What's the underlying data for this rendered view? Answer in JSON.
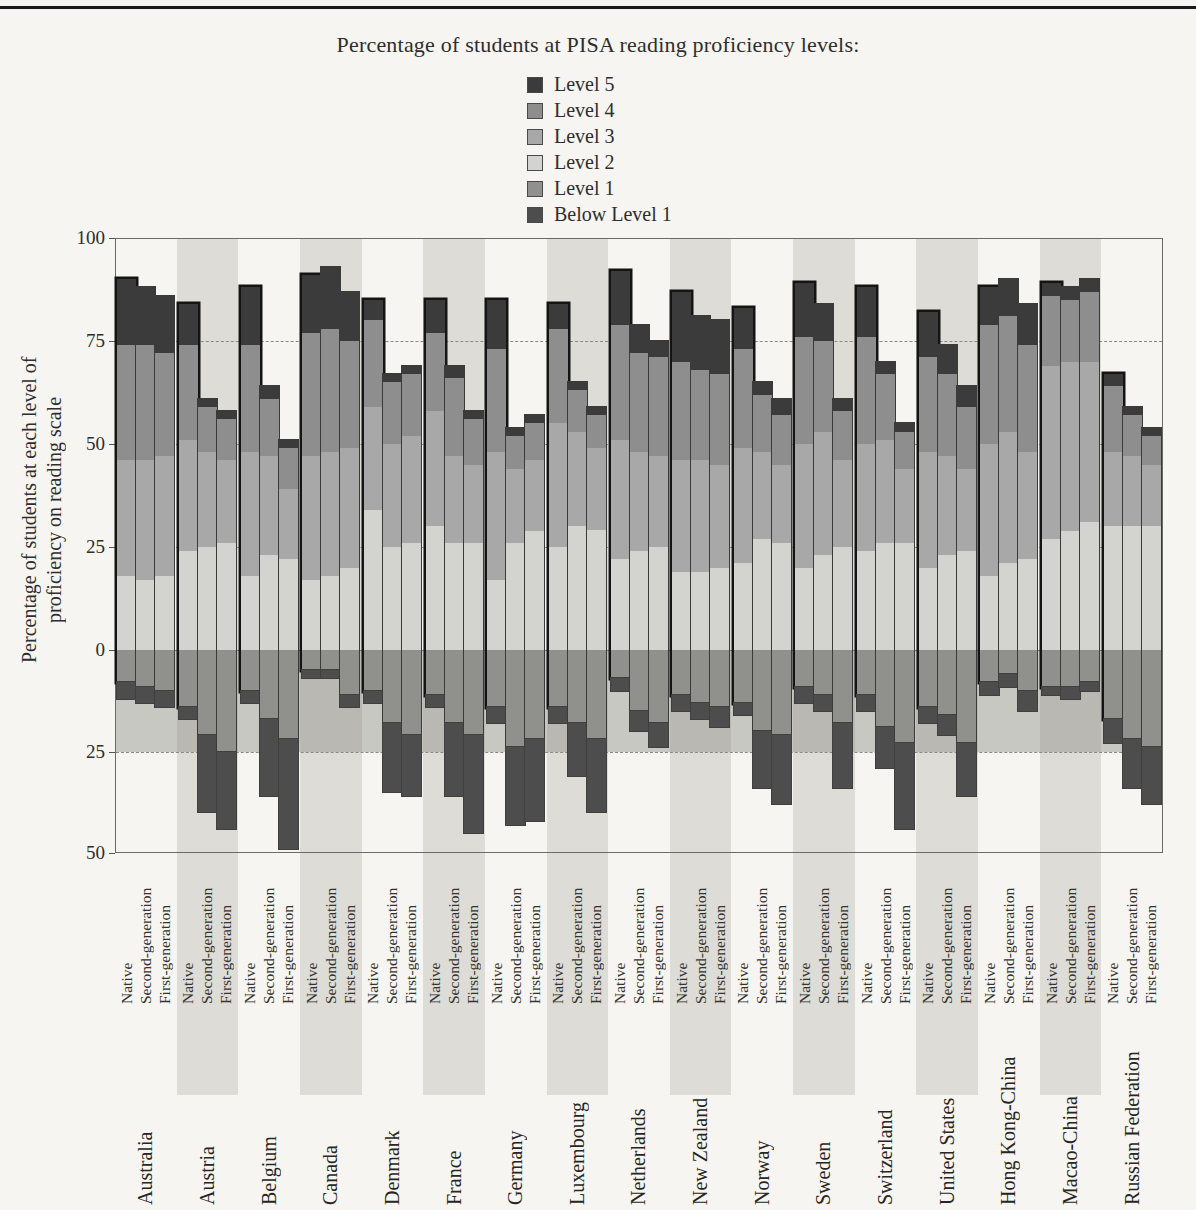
{
  "page": {
    "title": "Percentage of students at PISA reading proficiency levels:"
  },
  "legend": {
    "items": [
      {
        "label": "Level 5",
        "color": "#3b3b3b"
      },
      {
        "label": "Level 4",
        "color": "#8e8e8e"
      },
      {
        "label": "Level 3",
        "color": "#a8a8a8"
      },
      {
        "label": "Level 2",
        "color": "#d3d3d0"
      },
      {
        "label": "Level 1",
        "color": "#90908c"
      },
      {
        "label": "Below Level 1",
        "color": "#4d4d4d"
      }
    ]
  },
  "colors": {
    "level5": "#3b3b3b",
    "level4": "#8e8e8e",
    "level3": "#a8a8a8",
    "level2": "#d3d3d0",
    "level1": "#90908c",
    "below_level1": "#4d4d4d",
    "band": "#dddcd7",
    "page_bg": "#f6f5f1"
  },
  "chart_data": {
    "type": "bar",
    "stacked": true,
    "diverging": true,
    "title": "Percentage of students at PISA reading proficiency levels:",
    "ylabel_lines": [
      "Percentage of students at each level of",
      "proficiency on reading scale"
    ],
    "xlabel": "",
    "ylim": [
      -50,
      100
    ],
    "grid": "dashed horizontal at 75, 50, 25 and -25; solid zero line",
    "legend_position": "top-center",
    "y_ticks": [
      {
        "value": 100,
        "label": "100"
      },
      {
        "value": 75,
        "label": "75"
      },
      {
        "value": 50,
        "label": "50"
      },
      {
        "value": 25,
        "label": "25"
      },
      {
        "value": 0,
        "label": "0"
      },
      {
        "value": -25,
        "label": "25"
      },
      {
        "value": -50,
        "label": "50"
      }
    ],
    "up_levels": [
      "Level 2",
      "Level 3",
      "Level 4",
      "Level 5"
    ],
    "down_levels": [
      "Level 1",
      "Below Level 1"
    ],
    "group_labels": [
      "Native",
      "Second-generation",
      "First-generation"
    ],
    "countries": [
      {
        "name": "Australia",
        "band": false,
        "bars": [
          {
            "label": "Native",
            "up": [
              18,
              28,
              28,
              16
            ],
            "down": [
              8,
              4
            ]
          },
          {
            "label": "Second-generation",
            "up": [
              17,
              29,
              28,
              14
            ],
            "down": [
              9,
              4
            ]
          },
          {
            "label": "First-generation",
            "up": [
              18,
              29,
              25,
              14
            ],
            "down": [
              10,
              4
            ]
          }
        ]
      },
      {
        "name": "Austria",
        "band": true,
        "bars": [
          {
            "label": "Native",
            "up": [
              24,
              27,
              23,
              10
            ],
            "down": [
              14,
              3
            ]
          },
          {
            "label": "Second-generation",
            "up": [
              25,
              23,
              11,
              2
            ],
            "down": [
              21,
              19
            ]
          },
          {
            "label": "First-generation",
            "up": [
              26,
              20,
              10,
              2
            ],
            "down": [
              25,
              19
            ]
          }
        ]
      },
      {
        "name": "Belgium",
        "band": false,
        "bars": [
          {
            "label": "Native",
            "up": [
              18,
              30,
              26,
              14
            ],
            "down": [
              10,
              3
            ]
          },
          {
            "label": "Second-generation",
            "up": [
              23,
              24,
              14,
              3
            ],
            "down": [
              17,
              19
            ]
          },
          {
            "label": "First-generation",
            "up": [
              22,
              17,
              10,
              2
            ],
            "down": [
              22,
              27
            ]
          }
        ]
      },
      {
        "name": "Canada",
        "band": true,
        "bars": [
          {
            "label": "Native",
            "up": [
              17,
              30,
              30,
              14
            ],
            "down": [
              5,
              2
            ]
          },
          {
            "label": "Second-generation",
            "up": [
              18,
              30,
              30,
              15
            ],
            "down": [
              5,
              2
            ]
          },
          {
            "label": "First-generation",
            "up": [
              20,
              29,
              26,
              12
            ],
            "down": [
              11,
              3
            ]
          }
        ]
      },
      {
        "name": "Denmark",
        "band": false,
        "bars": [
          {
            "label": "Native",
            "up": [
              34,
              25,
              21,
              5
            ],
            "down": [
              10,
              3
            ]
          },
          {
            "label": "Second-generation",
            "up": [
              25,
              25,
              15,
              2
            ],
            "down": [
              18,
              17
            ]
          },
          {
            "label": "First-generation",
            "up": [
              26,
              26,
              15,
              2
            ],
            "down": [
              21,
              15
            ]
          }
        ]
      },
      {
        "name": "France",
        "band": true,
        "bars": [
          {
            "label": "Native",
            "up": [
              30,
              28,
              19,
              8
            ],
            "down": [
              11,
              3
            ]
          },
          {
            "label": "Second-generation",
            "up": [
              26,
              21,
              19,
              3
            ],
            "down": [
              18,
              18
            ]
          },
          {
            "label": "First-generation",
            "up": [
              26,
              19,
              11,
              2
            ],
            "down": [
              21,
              24
            ]
          }
        ]
      },
      {
        "name": "Germany",
        "band": false,
        "bars": [
          {
            "label": "Native",
            "up": [
              17,
              31,
              25,
              12
            ],
            "down": [
              14,
              4
            ]
          },
          {
            "label": "Second-generation",
            "up": [
              26,
              18,
              8,
              2
            ],
            "down": [
              24,
              19
            ]
          },
          {
            "label": "First-generation",
            "up": [
              29,
              17,
              9,
              2
            ],
            "down": [
              22,
              20
            ]
          }
        ]
      },
      {
        "name": "Luxembourg",
        "band": true,
        "bars": [
          {
            "label": "Native",
            "up": [
              25,
              30,
              23,
              6
            ],
            "down": [
              14,
              4
            ]
          },
          {
            "label": "Second-generation",
            "up": [
              30,
              23,
              10,
              2
            ],
            "down": [
              18,
              13
            ]
          },
          {
            "label": "First-generation",
            "up": [
              29,
              20,
              8,
              2
            ],
            "down": [
              22,
              18
            ]
          }
        ]
      },
      {
        "name": "Netherlands",
        "band": false,
        "bars": [
          {
            "label": "Native",
            "up": [
              22,
              29,
              28,
              13
            ],
            "down": [
              7,
              3
            ]
          },
          {
            "label": "Second-generation",
            "up": [
              24,
              24,
              24,
              7
            ],
            "down": [
              15,
              5
            ]
          },
          {
            "label": "First-generation",
            "up": [
              25,
              22,
              24,
              4
            ],
            "down": [
              18,
              6
            ]
          }
        ]
      },
      {
        "name": "New Zealand",
        "band": true,
        "bars": [
          {
            "label": "Native",
            "up": [
              19,
              27,
              24,
              17
            ],
            "down": [
              11,
              4
            ]
          },
          {
            "label": "Second-generation",
            "up": [
              19,
              27,
              22,
              13
            ],
            "down": [
              13,
              4
            ]
          },
          {
            "label": "First-generation",
            "up": [
              20,
              25,
              22,
              13
            ],
            "down": [
              14,
              5
            ]
          }
        ]
      },
      {
        "name": "Norway",
        "band": false,
        "bars": [
          {
            "label": "Native",
            "up": [
              21,
              28,
              24,
              10
            ],
            "down": [
              13,
              3
            ]
          },
          {
            "label": "Second-generation",
            "up": [
              27,
              21,
              14,
              3
            ],
            "down": [
              20,
              14
            ]
          },
          {
            "label": "First-generation",
            "up": [
              26,
              19,
              12,
              4
            ],
            "down": [
              21,
              17
            ]
          }
        ]
      },
      {
        "name": "Sweden",
        "band": true,
        "bars": [
          {
            "label": "Native",
            "up": [
              20,
              30,
              26,
              13
            ],
            "down": [
              9,
              4
            ]
          },
          {
            "label": "Second-generation",
            "up": [
              23,
              30,
              22,
              9
            ],
            "down": [
              11,
              4
            ]
          },
          {
            "label": "First-generation",
            "up": [
              25,
              21,
              12,
              3
            ],
            "down": [
              18,
              16
            ]
          }
        ]
      },
      {
        "name": "Switzerland",
        "band": false,
        "bars": [
          {
            "label": "Native",
            "up": [
              24,
              26,
              26,
              12
            ],
            "down": [
              11,
              4
            ]
          },
          {
            "label": "Second-generation",
            "up": [
              26,
              25,
              16,
              3
            ],
            "down": [
              19,
              10
            ]
          },
          {
            "label": "First-generation",
            "up": [
              26,
              18,
              9,
              2
            ],
            "down": [
              23,
              21
            ]
          }
        ]
      },
      {
        "name": "United States",
        "band": true,
        "bars": [
          {
            "label": "Native",
            "up": [
              20,
              28,
              23,
              11
            ],
            "down": [
              14,
              4
            ]
          },
          {
            "label": "Second-generation",
            "up": [
              23,
              24,
              20,
              7
            ],
            "down": [
              16,
              5
            ]
          },
          {
            "label": "First-generation",
            "up": [
              24,
              20,
              15,
              5
            ],
            "down": [
              23,
              13
            ]
          }
        ]
      },
      {
        "name": "Hong Kong-China",
        "band": false,
        "bars": [
          {
            "label": "Native",
            "up": [
              18,
              32,
              29,
              9
            ],
            "down": [
              8,
              3
            ]
          },
          {
            "label": "Second-generation",
            "up": [
              21,
              32,
              28,
              9
            ],
            "down": [
              6,
              3
            ]
          },
          {
            "label": "First-generation",
            "up": [
              22,
              26,
              26,
              10
            ],
            "down": [
              10,
              5
            ]
          }
        ]
      },
      {
        "name": "Macao-China",
        "band": true,
        "bars": [
          {
            "label": "Native",
            "up": [
              27,
              42,
              17,
              3
            ],
            "down": [
              9,
              2
            ]
          },
          {
            "label": "Second-generation",
            "up": [
              29,
              41,
              15,
              3
            ],
            "down": [
              9,
              3
            ]
          },
          {
            "label": "First-generation",
            "up": [
              31,
              39,
              17,
              3
            ],
            "down": [
              8,
              2
            ]
          }
        ]
      },
      {
        "name": "Russian Federation",
        "band": false,
        "bars": [
          {
            "label": "Native",
            "up": [
              30,
              18,
              16,
              3
            ],
            "down": [
              17,
              6
            ]
          },
          {
            "label": "Second-generation",
            "up": [
              30,
              17,
              10,
              2
            ],
            "down": [
              22,
              12
            ]
          },
          {
            "label": "First-generation",
            "up": [
              30,
              15,
              7,
              2
            ],
            "down": [
              24,
              14
            ]
          }
        ]
      }
    ]
  }
}
